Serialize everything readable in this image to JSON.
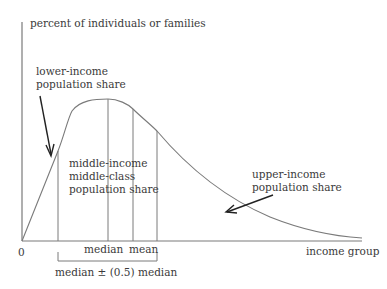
{
  "diagram": {
    "y_axis_label": "percent of individuals or families",
    "x_axis_label": "income group",
    "origin_label": "0",
    "annotations": {
      "lower": [
        "lower-income",
        "population share"
      ],
      "middle": [
        "middle-income",
        "middle-class",
        "population share"
      ],
      "upper": [
        "upper-income",
        "population share"
      ]
    },
    "markers": {
      "median": "median",
      "mean": "mean"
    },
    "bracket_label": "median ± (0.5) median"
  },
  "colors": {
    "line": "#7a7a7a",
    "arrow": "#222222",
    "text": "#3a3a3a"
  }
}
